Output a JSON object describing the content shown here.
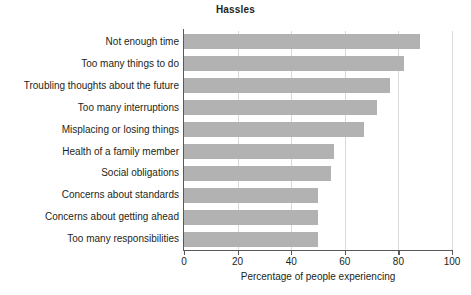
{
  "chart_data": {
    "type": "bar",
    "orientation": "horizontal",
    "title": "Hassles",
    "xlabel": "Percentage of people experiencing",
    "ylabel": "",
    "xlim": [
      0,
      100
    ],
    "xticks": [
      0,
      20,
      40,
      60,
      80,
      100
    ],
    "xtick_labels": [
      "0",
      "20",
      "40",
      "60",
      "80",
      "100"
    ],
    "grid": "vertical",
    "legend": "none",
    "bar_color": "#b2b2b2",
    "categories": [
      "Not enough time",
      "Too many things to do",
      "Troubling thoughts about the future",
      "Too many interruptions",
      "Misplacing or losing things",
      "Health of a family member",
      "Social obligations",
      "Concerns about standards",
      "Concerns about getting ahead",
      "Too many responsibilities"
    ],
    "values": [
      88,
      82,
      77,
      72,
      67,
      56,
      55,
      50,
      50,
      50
    ]
  }
}
